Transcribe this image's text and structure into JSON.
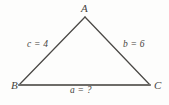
{
  "figure": {
    "type": "triangle-diagram",
    "background_color": "#fdfdfc",
    "stroke_color": "#4a4845",
    "base_stroke_color": "#6e6c68",
    "text_color": "#46443f",
    "vertices": {
      "A": {
        "label": "A",
        "x": 85,
        "y": 17
      },
      "B": {
        "label": "B",
        "x": 19,
        "y": 85
      },
      "C": {
        "label": "C",
        "x": 150,
        "y": 85
      }
    },
    "sides": {
      "left": {
        "label": "c = 4",
        "variable": "c",
        "value": "4",
        "between": "B-A"
      },
      "right": {
        "label": "b = 6",
        "variable": "b",
        "value": "6",
        "between": "A-C"
      },
      "bottom": {
        "label": "a = ?",
        "variable": "a",
        "value": "?",
        "between": "B-C"
      }
    }
  },
  "diagram_data": {
    "shape": "triangle",
    "vertex_labels": [
      "A",
      "B",
      "C"
    ],
    "side_labels": [
      "c = 4",
      "b = 6",
      "a = ?"
    ],
    "known_lengths": {
      "c": 4,
      "b": 6
    },
    "unknown_lengths": {
      "a": "?"
    }
  }
}
